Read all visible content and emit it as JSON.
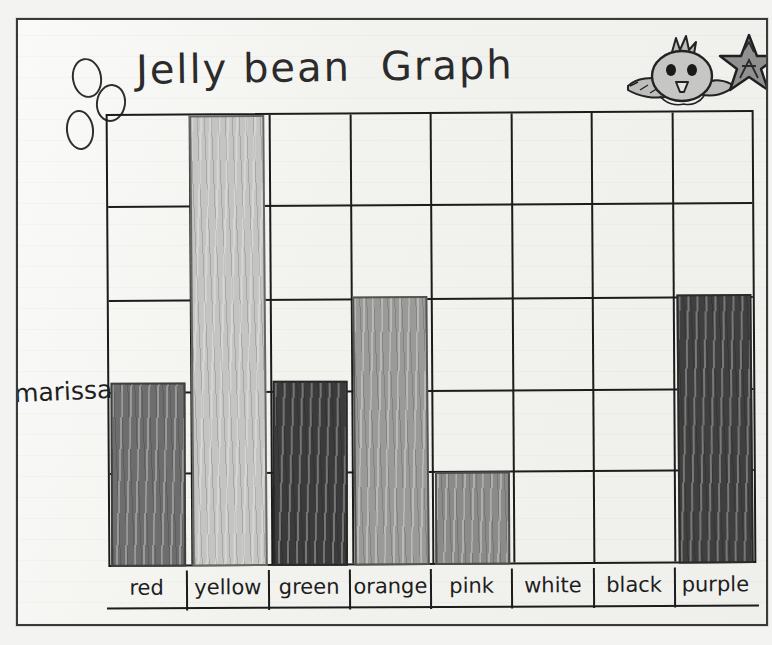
{
  "artifact": {
    "kind": "hand-drawn-bar-chart-on-paper",
    "title_word_1": "Jelly bean",
    "title_word_2": "Graph",
    "student_name": "marissa"
  },
  "stickers": {
    "bird": "bird-sticker",
    "star": "star-sticker"
  },
  "doodles": {
    "circle_1": "hand-drawn-oval",
    "circle_2": "hand-drawn-oval",
    "circle_3": "hand-drawn-oval"
  },
  "chart_data": {
    "type": "bar",
    "xlabel": "",
    "ylabel": "",
    "categories": [
      "red",
      "yellow",
      "green",
      "orange",
      "pink",
      "white",
      "black",
      "purple"
    ],
    "values": [
      2,
      5,
      2,
      3,
      1,
      0,
      0,
      3
    ],
    "ylim": [
      0,
      5
    ],
    "grid": true,
    "grid_rows": 5,
    "grid_columns": 8,
    "legend": "none",
    "annotations": [
      "marissa"
    ],
    "bar_fills": [
      "#6d6d6d",
      "#c4c4c2",
      "#3b3b3b",
      "#9a9a98",
      "#8b8b89",
      "none",
      "none",
      "#3f3f3f"
    ]
  },
  "colors": {
    "paper": "#f6f6f4",
    "ink": "#1c1c1c",
    "page_background": "#f3f3f1"
  }
}
